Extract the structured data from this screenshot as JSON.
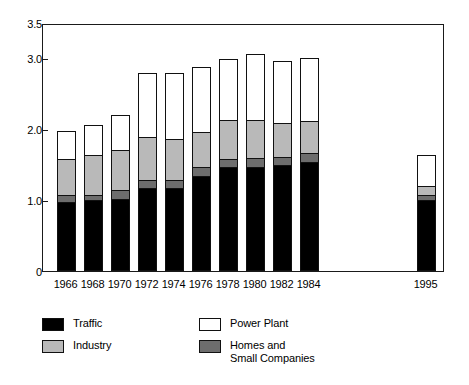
{
  "chart_data": {
    "type": "bar",
    "stacked": true,
    "title": "",
    "xlabel": "",
    "ylabel": "",
    "ylim": [
      0,
      3.5
    ],
    "yticks": [
      0,
      1.0,
      2.0,
      3.0,
      3.5
    ],
    "ytick_labels": [
      "0",
      "1.0",
      "2.0",
      "3.0",
      "3.5"
    ],
    "grid": false,
    "legend_position": "below-plot",
    "categories": [
      "1966",
      "1968",
      "1970",
      "1972",
      "1974",
      "1976",
      "1978",
      "1980",
      "1982",
      "1984",
      "1995"
    ],
    "series": [
      {
        "name": "Traffic",
        "color": "#000000",
        "values": [
          0.97,
          1.0,
          1.01,
          1.17,
          1.17,
          1.34,
          1.47,
          1.47,
          1.5,
          1.54,
          1.0
        ]
      },
      {
        "name": "Homes and\nSmall Companies",
        "color": "#6d6d6d",
        "values": [
          0.1,
          0.07,
          0.13,
          0.11,
          0.11,
          0.13,
          0.11,
          0.12,
          0.11,
          0.12,
          0.07
        ]
      },
      {
        "name": "Industry",
        "color": "#b9b9b9",
        "values": [
          0.52,
          0.57,
          0.58,
          0.61,
          0.59,
          0.5,
          0.56,
          0.54,
          0.49,
          0.46,
          0.14
        ]
      },
      {
        "name": "Power Plant",
        "color": "#ffffff",
        "values": [
          0.39,
          0.42,
          0.48,
          0.91,
          0.93,
          0.91,
          0.85,
          0.93,
          0.87,
          0.89,
          0.43
        ]
      }
    ],
    "totals": [
      1.98,
      2.06,
      2.2,
      2.8,
      2.8,
      2.88,
      2.99,
      3.06,
      2.97,
      3.01,
      1.64
    ]
  },
  "legend": {
    "items": [
      {
        "label": "Traffic",
        "swatch": "black"
      },
      {
        "label": "Industry",
        "swatch": "light-gray"
      },
      {
        "label": "Power Plant",
        "swatch": "white"
      },
      {
        "label": "Homes and\nSmall Companies",
        "swatch": "dark-gray"
      }
    ]
  },
  "colors": {
    "traffic": "#000000",
    "homes": "#6d6d6d",
    "industry": "#b9b9b9",
    "power_plant": "#ffffff",
    "frame": "#1a1a1a",
    "background": "#ffffff"
  }
}
